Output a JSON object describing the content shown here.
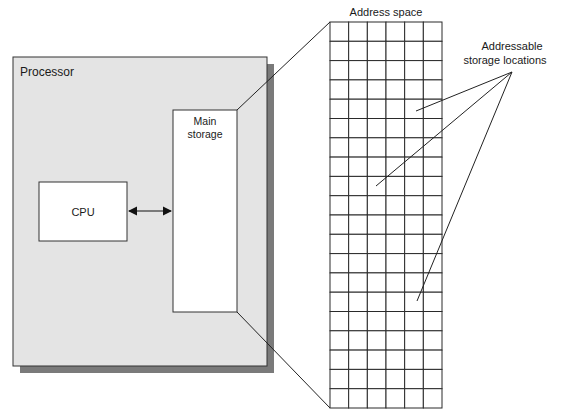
{
  "diagram": {
    "processor": {
      "label": "Processor"
    },
    "cpu": {
      "label": "CPU"
    },
    "main_storage": {
      "label_line1": "Main",
      "label_line2": "storage"
    },
    "address_space": {
      "title": "Address space",
      "rows": 20,
      "columns": 6
    },
    "callout": {
      "label_line1": "Addressable",
      "label_line2": "storage locations",
      "pointer_count": 3
    },
    "connections": [
      {
        "from": "CPU",
        "to": "Main storage",
        "type": "bidirectional-arrow"
      },
      {
        "from": "Main storage",
        "to": "Address space",
        "type": "expansion-lines"
      }
    ],
    "colors": {
      "processor_fill": "#e4e4e4",
      "shadow": "#7a7a7a",
      "box_fill": "#ffffff",
      "stroke": "#333333"
    }
  }
}
